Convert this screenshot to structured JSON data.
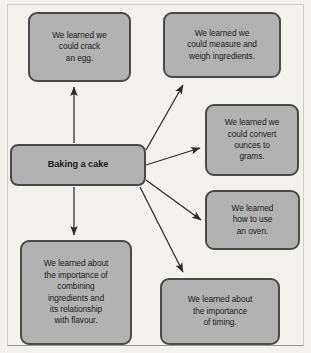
{
  "diagram": {
    "type": "mind-map",
    "title": "Baking a cake",
    "center": {
      "id": "baking-a-cake",
      "label": "Baking a cake",
      "bold": true
    },
    "style": {
      "node_fill": "#b2b2b2",
      "node_border": "#4a4a4a",
      "arrow_color": "#2b2b2b",
      "canvas_background": "#f3f2ef",
      "text_color": "#1a1a1a"
    },
    "branches": [
      {
        "id": "crack-an-egg",
        "lines": [
          "We learned we",
          "could crack",
          "an egg."
        ],
        "text": "We learned we could crack an egg.",
        "direction": "up"
      },
      {
        "id": "measure-and-weigh",
        "lines": [
          "We learned we",
          "could measure and",
          "weigh ingredients."
        ],
        "text": "We learned we could measure and weigh ingredients.",
        "direction": "up-right"
      },
      {
        "id": "convert-ounces-to-grams",
        "lines": [
          "We learned we",
          "could convert",
          "ounces to",
          "grams."
        ],
        "text": "We learned we could convert ounces to grams.",
        "direction": "right"
      },
      {
        "id": "how-to-use-an-oven",
        "lines": [
          "We learned",
          "how to use",
          "an oven."
        ],
        "text": "We learned how to use an oven.",
        "direction": "down-right"
      },
      {
        "id": "combining-ingredients-flavour",
        "lines": [
          "We learned about",
          "the importance of",
          "combining",
          "ingredients and",
          "its relationship",
          "with flavour."
        ],
        "text": "We learned about the importance of combining ingredients and its relationship with flavour.",
        "direction": "down"
      },
      {
        "id": "importance-of-timing",
        "lines": [
          "We learned about",
          "the importance",
          "of timing."
        ],
        "text": "We learned about the importance of timing.",
        "direction": "down-right-far"
      }
    ],
    "connectors": [
      {
        "id": "arrow-to-crack-an-egg",
        "from": "baking-a-cake",
        "to": "crack-an-egg"
      },
      {
        "id": "arrow-to-measure-and-weigh",
        "from": "baking-a-cake",
        "to": "measure-and-weigh"
      },
      {
        "id": "arrow-to-convert-ounces-to-grams",
        "from": "baking-a-cake",
        "to": "convert-ounces-to-grams"
      },
      {
        "id": "arrow-to-how-to-use-an-oven",
        "from": "baking-a-cake",
        "to": "how-to-use-an-oven"
      },
      {
        "id": "arrow-to-combining-ingredients-flavour",
        "from": "baking-a-cake",
        "to": "combining-ingredients-flavour"
      },
      {
        "id": "arrow-to-importance-of-timing",
        "from": "baking-a-cake",
        "to": "importance-of-timing"
      }
    ]
  }
}
